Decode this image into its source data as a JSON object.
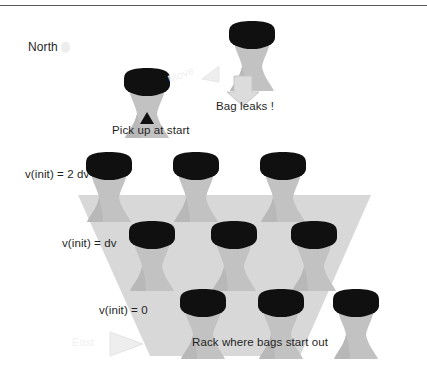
{
  "figure": {
    "background_color": "#ffffff",
    "rule_color": "#5a5a5a"
  },
  "colors": {
    "bag_body": "#c2c2c2",
    "bag_body_shadow": "#b0b0b0",
    "bag_cap": "#101010",
    "rack_fill": "#d8d8d8",
    "arrow_fill": "#dcdcdc",
    "arrow_stroke": "#c0c0c0",
    "faint_text": "#f0f0f0",
    "text": "#1f1f1f",
    "triangle_black": "#101010"
  },
  "labels": {
    "north": "North",
    "move_faint": "Move",
    "bag_leaks": "Bag leaks !",
    "pick_up_at_start": "Pick up at start",
    "v_init_2dv": "v(init) = 2 dv",
    "v_init_dv": "v(init) = dv",
    "v_init_0": "v(init) = 0",
    "rack_caption": "Rack where bags start out",
    "east_faint": "East"
  },
  "icons": {
    "north_arrow": "north-arrow-icon",
    "move_arrow": "move-arrow-icon",
    "leak_arrow": "down-arrow-icon",
    "pickup_marker": "up-triangle-icon",
    "east_arrow": "east-arrow-icon"
  },
  "rack": {
    "rows": [
      {
        "label_key": "v_init_2dv",
        "value": "2 dv",
        "bag_count": 3
      },
      {
        "label_key": "v_init_dv",
        "value": "dv",
        "bag_count": 3
      },
      {
        "label_key": "v_init_0",
        "value": "0",
        "bag_count": 3
      }
    ],
    "total_bags": 9
  },
  "floating_bags": [
    {
      "name": "bag-in-transit",
      "state": "moving"
    },
    {
      "name": "bag-leaking",
      "state": "leaking"
    }
  ]
}
